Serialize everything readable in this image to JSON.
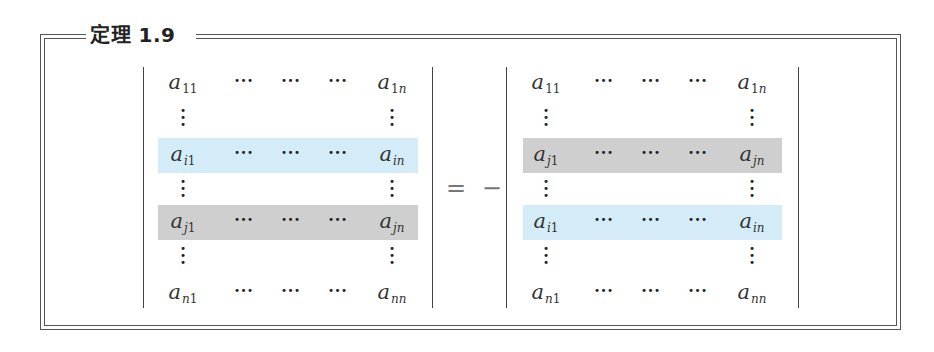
{
  "theorem": {
    "title": "定理 1.9"
  },
  "colors": {
    "row_i_highlight": "#d3ecf8",
    "row_j_highlight": "#cfcfcf",
    "frame": "#555555"
  },
  "equation": {
    "operator": "= −",
    "left_determinant": {
      "rows": [
        {
          "row": "1",
          "first": "a",
          "first_sub": "11",
          "last": "a",
          "last_sub": "1n",
          "highlight": "none"
        },
        {
          "row": "vdots"
        },
        {
          "row": "i",
          "first": "a",
          "first_sub": "i1",
          "last": "a",
          "last_sub": "in",
          "highlight": "blue"
        },
        {
          "row": "vdots"
        },
        {
          "row": "j",
          "first": "a",
          "first_sub": "j1",
          "last": "a",
          "last_sub": "jn",
          "highlight": "gray"
        },
        {
          "row": "vdots"
        },
        {
          "row": "n",
          "first": "a",
          "first_sub": "n1",
          "last": "a",
          "last_sub": "nn",
          "highlight": "none"
        }
      ]
    },
    "right_determinant": {
      "rows": [
        {
          "row": "1",
          "first": "a",
          "first_sub": "11",
          "last": "a",
          "last_sub": "1n",
          "highlight": "none"
        },
        {
          "row": "vdots"
        },
        {
          "row": "j",
          "first": "a",
          "first_sub": "j1",
          "last": "a",
          "last_sub": "jn",
          "highlight": "gray"
        },
        {
          "row": "vdots"
        },
        {
          "row": "i",
          "first": "a",
          "first_sub": "i1",
          "last": "a",
          "last_sub": "in",
          "highlight": "blue"
        },
        {
          "row": "vdots"
        },
        {
          "row": "n",
          "first": "a",
          "first_sub": "n1",
          "last": "a",
          "last_sub": "nn",
          "highlight": "none"
        }
      ]
    },
    "hdots": "···",
    "vdots": "⋮"
  }
}
